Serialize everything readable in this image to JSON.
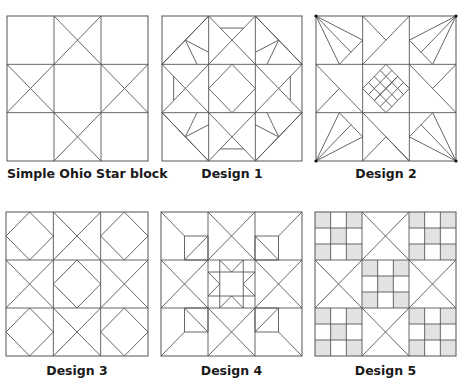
{
  "colors": {
    "line": "#555555",
    "fill_shaded": "#e2e2e2",
    "dot": "#111111",
    "caption": "#1a1a1a"
  },
  "blocks": [
    {
      "id": "ohio",
      "caption": "Simple Ohio Star block",
      "box": {
        "x": 7,
        "y": 16,
        "w": 141,
        "h": 145
      },
      "caption_y": 166
    },
    {
      "id": "d1",
      "caption": "Design 1",
      "box": {
        "x": 162,
        "y": 16,
        "w": 140,
        "h": 145
      },
      "caption_y": 166
    },
    {
      "id": "d2",
      "caption": "Design 2",
      "box": {
        "x": 316,
        "y": 16,
        "w": 140,
        "h": 145
      },
      "caption_y": 166
    },
    {
      "id": "d3",
      "caption": "Design 3",
      "box": {
        "x": 6,
        "y": 212,
        "w": 142,
        "h": 144
      },
      "caption_y": 363
    },
    {
      "id": "d4",
      "caption": "Design 4",
      "box": {
        "x": 161,
        "y": 212,
        "w": 141,
        "h": 144
      },
      "caption_y": 363
    },
    {
      "id": "d5",
      "caption": "Design 5",
      "box": {
        "x": 315,
        "y": 212,
        "w": 141,
        "h": 144
      },
      "caption_y": 363
    }
  ]
}
